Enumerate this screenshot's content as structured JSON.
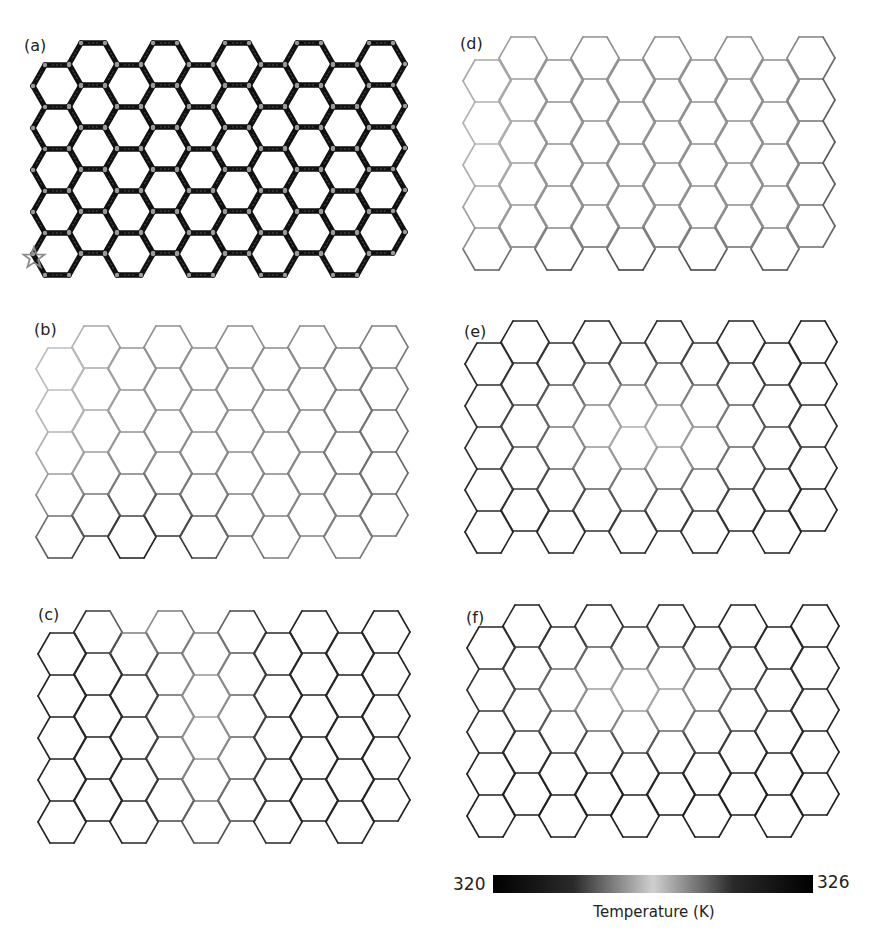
{
  "figure": {
    "grid": {
      "columns": 10,
      "hexes_per_column": 5,
      "hex_radius": 24,
      "hex_height": 42,
      "column_step": 36
    },
    "panels": [
      {
        "id": "a",
        "label": "(a)",
        "label_pos": [
          24,
          38
        ],
        "origin": [
          33,
          65
        ],
        "odd_column_shift": -22,
        "style": "initial",
        "base_darkness": 1.0,
        "heat_source_marker": {
          "icon": "star-icon",
          "pos": [
            34,
            258
          ],
          "color": "#8a8a8a"
        },
        "field": []
      },
      {
        "id": "b",
        "label": "(b)",
        "label_pos": [
          34,
          322
        ],
        "origin": [
          36,
          348
        ],
        "odd_column_shift": -22,
        "style": "field",
        "base_darkness": 0.35,
        "field": [
          {
            "cx": 0.25,
            "cy": 1.0,
            "rx": 0.28,
            "ry": 0.28,
            "value": 0.95
          },
          {
            "cx": 1.0,
            "cy": 0.6,
            "rx": 0.25,
            "ry": 0.6,
            "value": 0.55
          },
          {
            "cx": 0.05,
            "cy": 0.2,
            "rx": 0.15,
            "ry": 0.5,
            "value": 0.1
          }
        ]
      },
      {
        "id": "c",
        "label": "(c)",
        "label_pos": [
          38,
          607
        ],
        "origin": [
          38,
          633
        ],
        "odd_column_shift": -22,
        "style": "field",
        "base_darkness": 0.9,
        "field": [
          {
            "cx": 0.45,
            "cy": 0.45,
            "rx": 0.12,
            "ry": 0.55,
            "value": 0.25
          },
          {
            "cx": 0.3,
            "cy": 0.05,
            "rx": 0.12,
            "ry": 0.15,
            "value": 0.35
          }
        ]
      },
      {
        "id": "d",
        "label": "(d)",
        "label_pos": [
          460,
          36
        ],
        "origin": [
          463,
          60
        ],
        "odd_column_shift": -23,
        "style": "field",
        "base_darkness": 0.35,
        "field": [
          {
            "cx": 0.5,
            "cy": 1.05,
            "rx": 0.7,
            "ry": 0.15,
            "value": 0.85
          },
          {
            "cx": 1.0,
            "cy": 0.5,
            "rx": 0.08,
            "ry": 0.6,
            "value": 0.65
          },
          {
            "cx": 0.05,
            "cy": 0.4,
            "rx": 0.12,
            "ry": 0.4,
            "value": 0.15
          }
        ]
      },
      {
        "id": "e",
        "label": "(e)",
        "label_pos": [
          464,
          324
        ],
        "origin": [
          465,
          343
        ],
        "odd_column_shift": -22,
        "style": "field",
        "base_darkness": 0.92,
        "field": [
          {
            "cx": 0.48,
            "cy": 0.48,
            "rx": 0.32,
            "ry": 0.3,
            "value": 0.18
          }
        ]
      },
      {
        "id": "f",
        "label": "(f)",
        "label_pos": [
          466,
          610
        ],
        "origin": [
          467,
          627
        ],
        "odd_column_shift": -22,
        "style": "field",
        "base_darkness": 0.92,
        "field": [
          {
            "cx": 0.45,
            "cy": 0.38,
            "rx": 0.3,
            "ry": 0.22,
            "value": 0.2
          }
        ]
      }
    ]
  },
  "colorbar": {
    "min_label": "320",
    "max_label": "326",
    "title": "Temperature (K)",
    "min": 320,
    "max": 326,
    "colormap": "diverging-gray",
    "stops": [
      "#000000",
      "#2a2a2a",
      "#cfcfcf",
      "#2a2a2a",
      "#000000"
    ]
  },
  "colors": {
    "edge_dark": "#111111",
    "edge_light": "#d4d4d4",
    "vertex_marker": "#9a9a9a",
    "background": "#ffffff"
  }
}
